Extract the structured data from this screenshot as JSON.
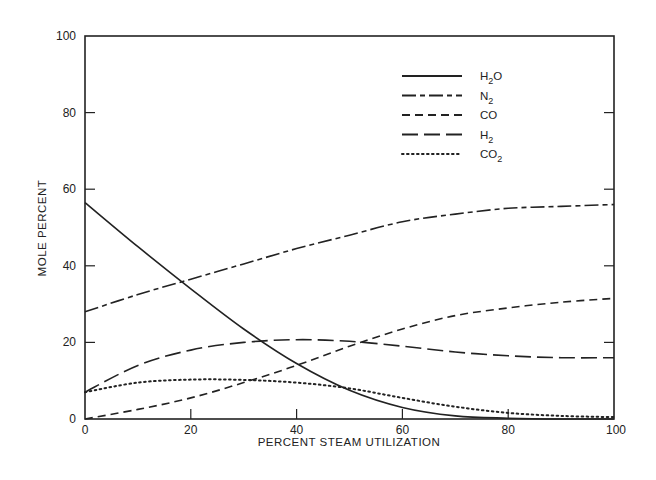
{
  "chart_data": {
    "type": "line",
    "title": "",
    "xlabel": "PERCENT STEAM UTILIZATION",
    "ylabel": "MOLE PERCENT",
    "xlim": [
      0,
      100
    ],
    "ylim": [
      0,
      100
    ],
    "xticks": [
      0,
      20,
      40,
      60,
      80,
      100
    ],
    "yticks": [
      0,
      20,
      40,
      60,
      80,
      100
    ],
    "grid": false,
    "legend_position": "upper right (inside)",
    "x": [
      0,
      10,
      20,
      30,
      40,
      50,
      60,
      70,
      80,
      90,
      100
    ],
    "series": [
      {
        "name": "H2O",
        "label": "H",
        "sub": "2",
        "suffix": "O",
        "style": "solid",
        "values": [
          56.5,
          45,
          34,
          23.5,
          14.5,
          7.5,
          3,
          0.8,
          0.2,
          0,
          0
        ]
      },
      {
        "name": "N2",
        "label": "N",
        "sub": "2",
        "suffix": "",
        "style": "dashdot",
        "values": [
          28,
          32.5,
          36.5,
          40.5,
          44.5,
          48,
          51.5,
          53.5,
          55,
          55.5,
          56
        ]
      },
      {
        "name": "CO",
        "label": "CO",
        "sub": "",
        "suffix": "",
        "style": "dashed",
        "values": [
          0,
          2.5,
          5.5,
          9.5,
          14,
          19,
          23.5,
          27,
          29,
          30.5,
          31.5
        ]
      },
      {
        "name": "H2",
        "label": "H",
        "sub": "2",
        "suffix": "",
        "style": "longdash",
        "values": [
          7,
          14,
          18,
          20,
          20.7,
          20.3,
          19,
          17.5,
          16.5,
          16,
          16
        ]
      },
      {
        "name": "CO2",
        "label": "CO",
        "sub": "2",
        "suffix": "",
        "style": "dotted",
        "values": [
          7,
          9.5,
          10.3,
          10.2,
          9.5,
          8,
          5.5,
          3.2,
          1.6,
          0.8,
          0.5
        ]
      }
    ]
  },
  "axes": {
    "x_title": "PERCENT STEAM UTILIZATION",
    "y_title": "MOLE PERCENT"
  }
}
